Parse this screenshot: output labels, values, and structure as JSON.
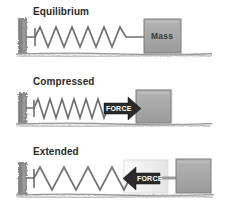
{
  "figure": {
    "background_color": "#ffffff"
  },
  "colors": {
    "wall": "#8e8e8e",
    "ground": "#9a9a9a",
    "spring": "#707070",
    "block_fill": "#a8a8a8",
    "block_stroke": "#787878",
    "ghost_fill": "#f0f0f0",
    "ghost_stroke": "#d8d8d8",
    "arrow": "#2a2a2a",
    "label_text": "#2b2b2b",
    "force_text": "#ffffff",
    "mass_text": "#3a3a3a"
  },
  "panels": [
    {
      "id": "equilibrium",
      "label": "Equilibrium",
      "spring": {
        "coils": 9,
        "state": "relaxed"
      },
      "block": {
        "label": "Mass",
        "position": "rest"
      },
      "force": {
        "present": false,
        "label": "",
        "direction": "none"
      },
      "ghost_block": {
        "present": false
      }
    },
    {
      "id": "compressed",
      "label": "Compressed",
      "spring": {
        "coils": 10,
        "state": "compressed"
      },
      "block": {
        "label": "",
        "position": "left"
      },
      "force": {
        "present": true,
        "label": "FORCE",
        "direction": "right"
      },
      "ghost_block": {
        "present": true,
        "position": "right"
      }
    },
    {
      "id": "extended",
      "label": "Extended",
      "spring": {
        "coils": 7,
        "state": "stretched"
      },
      "block": {
        "label": "",
        "position": "right"
      },
      "force": {
        "present": true,
        "label": "FORCE",
        "direction": "left"
      },
      "ghost_block": {
        "present": true,
        "position": "left"
      }
    }
  ],
  "icons": {
    "wall": "wall-hatch-icon",
    "ground": "ground-texture-icon",
    "spring": "spring-coil-icon",
    "arrow_right": "arrow-right-icon",
    "arrow_left": "arrow-left-icon"
  }
}
